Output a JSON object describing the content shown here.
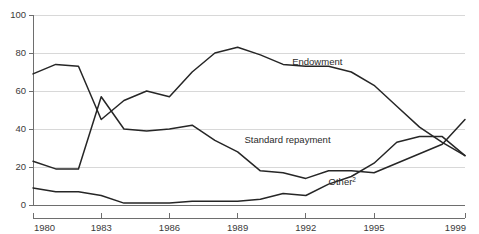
{
  "chart_data": {
    "type": "line",
    "title": "",
    "subtitle": "",
    "xlabel": "",
    "ylabel": "",
    "xlim": [
      1980,
      1999
    ],
    "ylim": [
      0,
      100
    ],
    "grid": true,
    "legend_position": "inline-annotations",
    "x": [
      1980,
      1981,
      1982,
      1983,
      1984,
      1985,
      1986,
      1987,
      1988,
      1989,
      1990,
      1991,
      1992,
      1993,
      1994,
      1995,
      1996,
      1997,
      1998,
      1999
    ],
    "y_ticks": [
      0,
      20,
      40,
      60,
      80,
      100
    ],
    "y_tick_labels": [
      "0",
      "20",
      "40",
      "60",
      "80",
      "100"
    ],
    "x_ticks": [
      1980,
      1983,
      1986,
      1989,
      1992,
      1995,
      1999
    ],
    "x_tick_labels": [
      "1980",
      "1983",
      "1986",
      "1989",
      "1992",
      "1995",
      "1999"
    ],
    "series": [
      {
        "name": "Endowment",
        "label": "Endowment",
        "label_suffix": "",
        "color": "#262626",
        "values": [
          69,
          74,
          73,
          45,
          55,
          60,
          57,
          70,
          80,
          83,
          79,
          74,
          73,
          73,
          70,
          63,
          52,
          41,
          33,
          26
        ]
      },
      {
        "name": "Standard repayment",
        "label": "Standard repayment",
        "label_suffix": "",
        "color": "#262626",
        "values": [
          23,
          19,
          19,
          57,
          40,
          39,
          40,
          42,
          34,
          28,
          18,
          17,
          14,
          18,
          18,
          17,
          22,
          27,
          32,
          45
        ]
      },
      {
        "name": "Other",
        "label": "Other",
        "label_suffix": "2",
        "color": "#262626",
        "values": [
          9,
          7,
          7,
          5,
          1,
          1,
          1,
          2,
          2,
          2,
          3,
          6,
          5,
          11,
          15,
          22,
          33,
          36,
          36,
          26
        ]
      }
    ],
    "annotations": [
      {
        "text": "Endowment",
        "x": 1991.4,
        "y": 73.5
      },
      {
        "text": "Standard repayment",
        "x": 1989.3,
        "y": 32.5
      },
      {
        "text": "Other",
        "sup": "2",
        "x": 1993.0,
        "y": 10.5
      }
    ]
  }
}
